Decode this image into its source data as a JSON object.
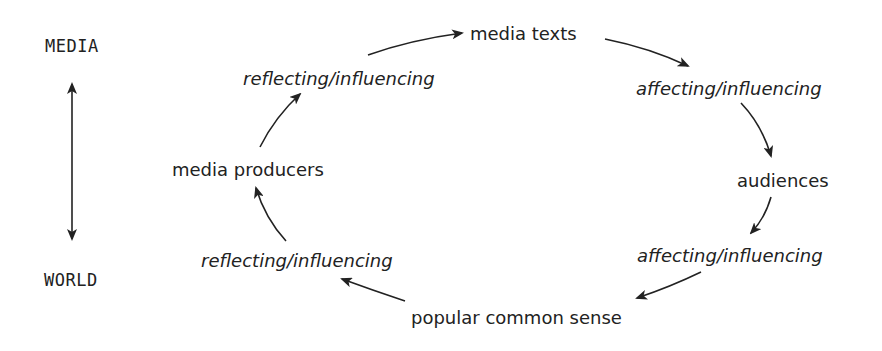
{
  "axis": {
    "top_label": "MEDIA",
    "bottom_label": "WORLD",
    "arrow": "double-headed-vertical"
  },
  "cycle": {
    "nodes": [
      {
        "id": "media_texts",
        "label": "media texts"
      },
      {
        "id": "audiences",
        "label": "audiences"
      },
      {
        "id": "popular_common_sense",
        "label": "popular common sense"
      },
      {
        "id": "media_producers",
        "label": "media producers"
      }
    ],
    "processes": [
      {
        "id": "p1",
        "label": "affecting/influencing",
        "from": "media_texts",
        "to": "audiences"
      },
      {
        "id": "p2",
        "label": "affecting/influencing",
        "from": "audiences",
        "to": "popular_common_sense"
      },
      {
        "id": "p3",
        "label": "reflecting/influencing",
        "from": "popular_common_sense",
        "to": "media_producers"
      },
      {
        "id": "p4",
        "label": "reflecting/influencing",
        "from": "media_producers",
        "to": "media_texts"
      }
    ],
    "direction": "clockwise"
  },
  "colors": {
    "ink": "#222222",
    "background": "#ffffff"
  }
}
